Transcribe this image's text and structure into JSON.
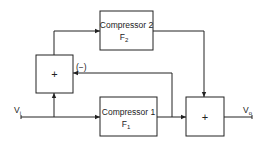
{
  "diagram": {
    "blocks": {
      "compressor2": {
        "title": "Compressor 2",
        "sym": "F",
        "sub": "2"
      },
      "compressor1": {
        "title": "Compressor 1",
        "sym": "F",
        "sub": "1"
      },
      "summer_left": {
        "op": "+"
      },
      "summer_right": {
        "op": "+"
      }
    },
    "labels": {
      "input": {
        "sym": "V",
        "sub": "i"
      },
      "output": {
        "sym": "V",
        "sub": "o"
      },
      "feedback_sign": "(−)"
    },
    "connections": [
      {
        "from": "input",
        "to": "compressor1"
      },
      {
        "from": "input",
        "to": "summer_left"
      },
      {
        "from": "summer_left",
        "to": "compressor2"
      },
      {
        "from": "compressor2",
        "to": "summer_right"
      },
      {
        "from": "compressor1",
        "to": "summer_right"
      },
      {
        "from": "compressor1",
        "to": "summer_left",
        "sign": "(−)"
      },
      {
        "from": "summer_right",
        "to": "output"
      }
    ],
    "colors": {
      "line": "#222222",
      "background": "#ffffff"
    }
  }
}
